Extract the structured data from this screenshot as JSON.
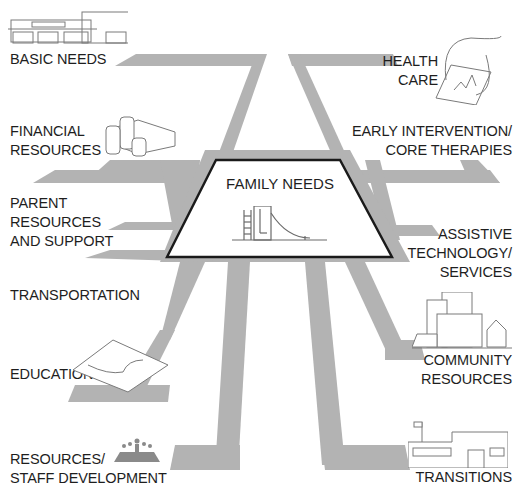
{
  "diagram": {
    "title": "Family Needs",
    "center": {
      "label": "FAMILY NEEDS",
      "icon": "playground-slide-icon"
    },
    "road_color": "#b3b3b3",
    "outline_color": "#1a1a1a",
    "left_labels": [
      {
        "id": "basic-needs",
        "lines": [
          "BASIC NEEDS"
        ],
        "icon": "storefront-building-icon"
      },
      {
        "id": "financial-resources",
        "lines": [
          "FINANCIAL",
          "RESOURCES"
        ],
        "icon": "coin-stacks-icon"
      },
      {
        "id": "parent-resources",
        "lines": [
          "PARENT",
          "RESOURCES",
          "AND SUPPORT"
        ],
        "icon": ""
      },
      {
        "id": "transportation",
        "lines": [
          "TRANSPORTATION"
        ],
        "icon": ""
      },
      {
        "id": "education",
        "lines": [
          "EDUCATION"
        ],
        "icon": "open-book-icon"
      },
      {
        "id": "resources-staff",
        "lines": [
          "RESOURCES/",
          "STAFF DEVELOPMENT"
        ],
        "icon": "meeting-group-icon"
      }
    ],
    "right_labels": [
      {
        "id": "health-care",
        "lines": [
          "HEALTH",
          "CARE"
        ],
        "icon": "stethoscope-clipboard-icon"
      },
      {
        "id": "early-intervention",
        "lines": [
          "EARLY INTERVENTION/",
          "CORE THERAPIES"
        ],
        "icon": ""
      },
      {
        "id": "assistive-technology",
        "lines": [
          "ASSISTIVE",
          "TECHNOLOGY/",
          "SERVICES"
        ],
        "icon": ""
      },
      {
        "id": "community-resources",
        "lines": [
          "COMMUNITY",
          "RESOURCES"
        ],
        "icon": "city-buildings-icon"
      },
      {
        "id": "transitions",
        "lines": [
          "TRANSITIONS"
        ],
        "icon": "school-building-icon"
      }
    ]
  }
}
